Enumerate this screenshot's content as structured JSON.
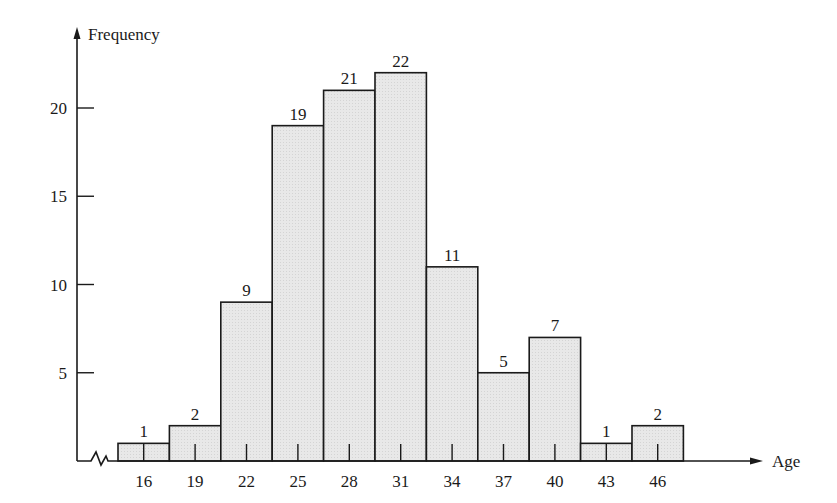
{
  "chart_data": {
    "type": "bar",
    "title": "",
    "xlabel": "Age",
    "ylabel": "Frequency",
    "categories": [
      "16",
      "19",
      "22",
      "25",
      "28",
      "31",
      "34",
      "37",
      "40",
      "43",
      "46"
    ],
    "values": [
      1,
      2,
      9,
      19,
      21,
      22,
      11,
      5,
      7,
      1,
      2
    ],
    "y_ticks": [
      5,
      10,
      15,
      20
    ],
    "ylim": [
      0,
      24
    ],
    "grid": false,
    "legend": null,
    "bar_labels": true,
    "histogram": true,
    "axis_break_on_x": true,
    "bar_fill": "#e6e6e6",
    "bar_stroke": "#1a1a1a"
  }
}
